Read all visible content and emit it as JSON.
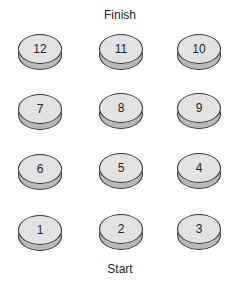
{
  "labels": {
    "top": "Finish",
    "bottom": "Start"
  },
  "colors": {
    "disk_top": "#e2e2e2",
    "disk_rim": "#b9b9b9",
    "outline": "#333333"
  },
  "disks": [
    {
      "label": "12",
      "x": 18,
      "y": 34
    },
    {
      "label": "11",
      "x": 99,
      "y": 34
    },
    {
      "label": "10",
      "x": 177,
      "y": 34
    },
    {
      "label": "7",
      "x": 18,
      "y": 94
    },
    {
      "label": "8",
      "x": 99,
      "y": 93
    },
    {
      "label": "9",
      "x": 177,
      "y": 93
    },
    {
      "label": "6",
      "x": 18,
      "y": 154
    },
    {
      "label": "5",
      "x": 99,
      "y": 153
    },
    {
      "label": "4",
      "x": 177,
      "y": 153
    },
    {
      "label": "1",
      "x": 18,
      "y": 215
    },
    {
      "label": "2",
      "x": 99,
      "y": 214
    },
    {
      "label": "3",
      "x": 177,
      "y": 214
    }
  ]
}
